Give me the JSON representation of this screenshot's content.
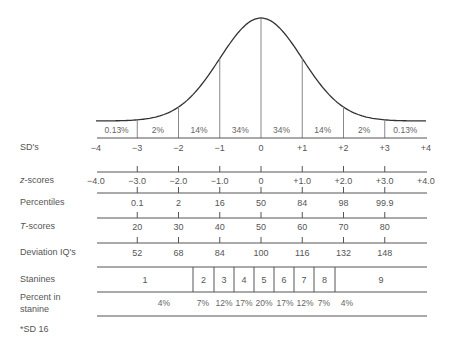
{
  "chart_data": {
    "type": "area",
    "title": "",
    "xlabel": "SD's",
    "ylabel": "",
    "x_range": [
      -4,
      4
    ],
    "grid": false,
    "area_percents": [
      "0.13%",
      "2%",
      "14%",
      "34%",
      "34%",
      "14%",
      "2%",
      "0.13%"
    ],
    "sd_ticks": [
      "−4",
      "−3",
      "−2",
      "−1",
      "0",
      "+1",
      "+2",
      "+3",
      "+4"
    ],
    "z_scores": [
      "−4.0",
      "−3.0",
      "−2.0",
      "−1.0",
      "0",
      "+1.0",
      "+2.0",
      "+3.0",
      "+4.0"
    ],
    "percentiles": [
      "0.1",
      "2",
      "16",
      "50",
      "84",
      "98",
      "99.9"
    ],
    "t_scores": [
      "20",
      "30",
      "40",
      "50",
      "60",
      "70",
      "80"
    ],
    "deviation_iqs": [
      "52",
      "68",
      "84",
      "100",
      "116",
      "132",
      "148"
    ],
    "stanines": [
      "1",
      "2",
      "3",
      "4",
      "5",
      "6",
      "7",
      "8",
      "9"
    ],
    "percent_in_stanine": [
      "4%",
      "7%",
      "12%",
      "17%",
      "20%",
      "17%",
      "12%",
      "7%",
      "4%"
    ]
  },
  "labels": {
    "sd": "SD's",
    "z_prefix": "z",
    "z_suffix": "-scores",
    "percentiles": "Percentiles",
    "t_prefix": "T",
    "t_suffix": "-scores",
    "deviation_iq": "Deviation IQ's",
    "stanines": "Stanines",
    "percent_in_line1": "Percent in",
    "percent_in_line2": "stanine",
    "footnote": "*SD  16"
  },
  "colors": {
    "curve": "#333333",
    "lines": "#555555",
    "dividers": "#888888",
    "text": "#555555"
  }
}
